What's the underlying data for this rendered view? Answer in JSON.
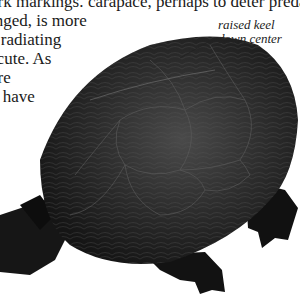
{
  "left_column": {
    "lines": [
      "ark markings.",
      "inged, is more",
      "s radiating",
      " scute. As",
      " are",
      "d have",
      "r"
    ]
  },
  "right_column": {
    "lines": [
      "carapace, perhaps to deter predators."
    ]
  },
  "annotation": {
    "line1": "raised keel",
    "line2": "down center"
  },
  "image": {
    "subject": "turtle-photo",
    "colors": {
      "shell": "#2a2a2a",
      "highlight": "#6a6a6a",
      "dark": "#0e0e0e"
    }
  }
}
